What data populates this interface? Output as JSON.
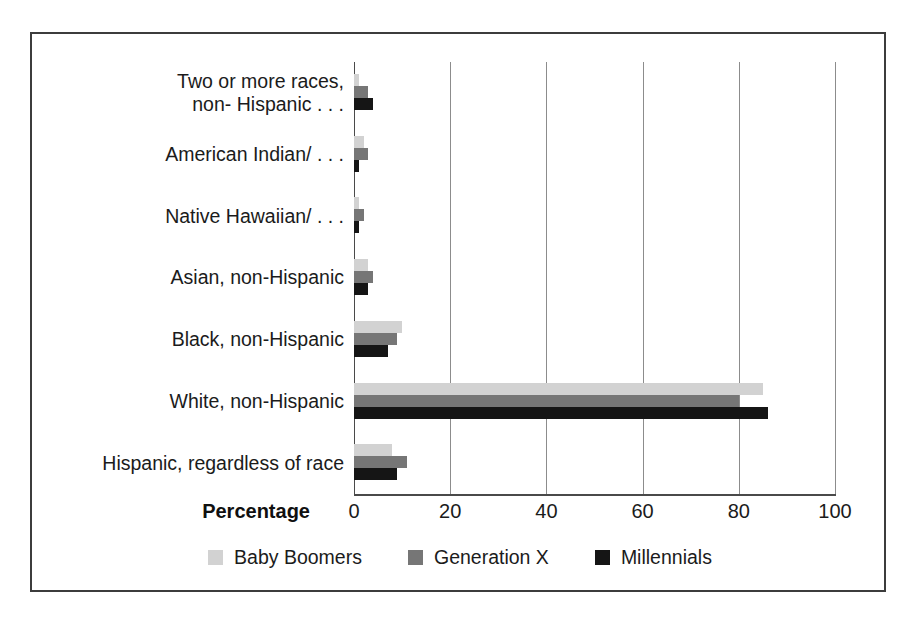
{
  "chart_data": {
    "type": "bar",
    "orientation": "horizontal",
    "title": "",
    "subtitle": "",
    "xlabel": "Percentage",
    "ylabel": "",
    "xlim": [
      0,
      100
    ],
    "xticks": [
      0,
      20,
      40,
      60,
      80,
      100
    ],
    "xtick_labels": [
      "0",
      "20",
      "40",
      "60",
      "80",
      "100"
    ],
    "grid": true,
    "grid_axis": "x",
    "legend_position": "bottom",
    "categories": [
      "Two or more races,\nnon- Hispanic . . .",
      "American Indian/ . . .",
      "Native Hawaiian/ . . .",
      "Asian, non-Hispanic",
      "Black, non-Hispanic",
      "White, non-Hispanic",
      "Hispanic, regardless of race"
    ],
    "series": [
      {
        "name": "Baby Boomers",
        "color": "#d2d2d2",
        "values": [
          1,
          2,
          1,
          3,
          10,
          85,
          8
        ]
      },
      {
        "name": "Generation X",
        "color": "#767676",
        "values": [
          3,
          3,
          2,
          4,
          9,
          80,
          11
        ]
      },
      {
        "name": "Millennials",
        "color": "#151515",
        "values": [
          4,
          1,
          1,
          3,
          7,
          86,
          9
        ]
      }
    ]
  },
  "colors": {
    "frame_border": "#3c3c3c",
    "gridline": "#8c8c8c",
    "axis": "#4a4a4a",
    "text": "#1b1b1b",
    "background": "#ffffff"
  }
}
